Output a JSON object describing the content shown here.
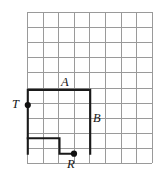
{
  "figure": {
    "canvas": {
      "width": 161,
      "height": 176,
      "background": "#ffffff"
    },
    "grid": {
      "origin_x": 27,
      "origin_y": 12,
      "columns": 8,
      "rows": 10,
      "cell_width": 15.6,
      "cell_height": 15.1,
      "line_color": "#9a9a9a",
      "line_width": 1
    },
    "path": {
      "color": "#1a1a1a",
      "width": 2.1,
      "points": [
        {
          "x": 27.8,
          "y": 153.7
        },
        {
          "x": 27.8,
          "y": 89.9
        },
        {
          "x": 90.2,
          "y": 89.9
        },
        {
          "x": 90.2,
          "y": 153.7
        }
      ],
      "points_lower": [
        {
          "x": 27.8,
          "y": 138.3
        },
        {
          "x": 59.5,
          "y": 138.3
        },
        {
          "x": 59.5,
          "y": 153.7
        },
        {
          "x": 74.0,
          "y": 153.7
        }
      ]
    },
    "vertices": [
      {
        "name": "T",
        "x": 27.8,
        "y": 105.0,
        "radius": 3.1
      },
      {
        "name": "R",
        "x": 74.0,
        "y": 153.7,
        "radius": 3.1
      }
    ],
    "labels": [
      {
        "id": "label-t",
        "text": "T",
        "x": 12,
        "y": 98
      },
      {
        "id": "label-a",
        "text": "A",
        "x": 61,
        "y": 76
      },
      {
        "id": "label-b",
        "text": "B",
        "x": 93,
        "y": 112
      },
      {
        "id": "label-r",
        "text": "R",
        "x": 67,
        "y": 158
      }
    ]
  }
}
